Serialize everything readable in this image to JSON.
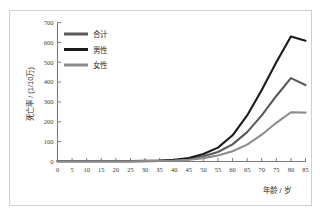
{
  "chart_data": {
    "type": "line",
    "title": "",
    "subtitle": "",
    "xlabel": "年龄 / 岁",
    "ylabel": "死亡率 / (1/10万)",
    "xlim": [
      0,
      85
    ],
    "ylim": [
      0,
      700
    ],
    "xticks": [
      "0",
      "5",
      "10",
      "15",
      "20",
      "25",
      "30",
      "35",
      "40",
      "45",
      "50",
      "55",
      "60",
      "65",
      "70",
      "75",
      "80",
      "85"
    ],
    "yticks": [
      "0",
      "100",
      "200",
      "300",
      "400",
      "500",
      "600",
      "700"
    ],
    "grid": false,
    "legend_position": "top-left",
    "x": [
      0,
      5,
      10,
      15,
      20,
      25,
      30,
      35,
      40,
      45,
      50,
      55,
      60,
      65,
      70,
      75,
      80,
      85
    ],
    "series": [
      {
        "name": "合计",
        "color": "#595959",
        "values": [
          1,
          1,
          1,
          1,
          1,
          1,
          2,
          3,
          6,
          12,
          26,
          48,
          86,
          148,
          232,
          330,
          420,
          385
        ]
      },
      {
        "name": "男性",
        "color": "#1a1a1a",
        "values": [
          1,
          1,
          1,
          1,
          1,
          2,
          3,
          5,
          9,
          18,
          38,
          70,
          132,
          232,
          360,
          500,
          630,
          608
        ]
      },
      {
        "name": "女性",
        "color": "#8c8c8c",
        "values": [
          1,
          1,
          1,
          1,
          1,
          1,
          2,
          3,
          5,
          9,
          17,
          30,
          52,
          85,
          135,
          195,
          248,
          246
        ]
      }
    ]
  },
  "legend": {
    "items": [
      {
        "label": "合计"
      },
      {
        "label": "男性"
      },
      {
        "label": "女性"
      }
    ]
  },
  "axes": {
    "x_title": "年龄 / 岁",
    "y_title": "死亡率 / (1/10万)"
  },
  "colors": {
    "total": "#595959",
    "male": "#1a1a1a",
    "female": "#8c8c8c",
    "axis": "#7a7a7a",
    "frame": "#cfcfcf",
    "text": "#2e2e2e"
  }
}
